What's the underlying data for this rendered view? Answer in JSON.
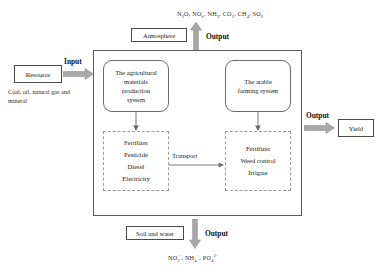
{
  "diagram": {
    "accent_gray": "#a8a8a8",
    "line_color": "#5a5a5a"
  },
  "emissions": {
    "atmosphere_outputs": "N₂O, NOₓ, NH₃, CO₂, CH₄, SO₂",
    "soil_water_outputs": "NO₃⁻, NH₄⁺, PO₄³⁻"
  },
  "nodes": {
    "atmosphere": "Atmosphere",
    "resource": "Resource",
    "resource_caption": "Coal, oil, natural gas and mineral",
    "yield": "Yield",
    "soil_and_water": "Soil and water"
  },
  "labels": {
    "input": "Input",
    "output_top": "Output",
    "output_right": "Output",
    "output_bottom": "Output",
    "transport": "Transport"
  },
  "subsystems": {
    "left": {
      "name": "The agricultural materials production system",
      "lines": [
        "The agricultural",
        "materials",
        "production",
        "system"
      ]
    },
    "right": {
      "name": "The arable farming system",
      "lines": [
        "The arable",
        "farming  system"
      ]
    }
  },
  "item_lists": {
    "left": [
      "Fertilizer",
      "Pesticide",
      "Diesel",
      "Electricity"
    ],
    "right": [
      "Fertilizer",
      "Weed control",
      "Irrigate"
    ]
  }
}
